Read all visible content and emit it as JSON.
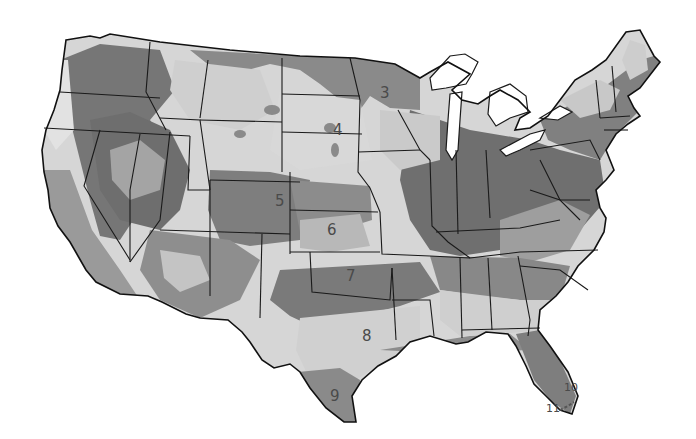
{
  "map": {
    "type": "zone-map",
    "region": "Contiguous United States",
    "style": "grayscale shaded zones with state boundaries",
    "colors": {
      "background": "#ffffff",
      "land_light": "#d9d9d9",
      "land_mid": "#a8a8a8",
      "land_dark": "#7d7d7d",
      "land_darkest": "#626262",
      "water": "#ffffff",
      "border": "#1a1a1a",
      "label": "#4a4a4a"
    },
    "zone_labels": [
      {
        "id": "3",
        "text": "3",
        "x": 380,
        "y": 98
      },
      {
        "id": "4",
        "text": "4",
        "x": 333,
        "y": 135
      },
      {
        "id": "5",
        "text": "5",
        "x": 275,
        "y": 206
      },
      {
        "id": "6",
        "text": "6",
        "x": 327,
        "y": 235
      },
      {
        "id": "7",
        "text": "7",
        "x": 346,
        "y": 281
      },
      {
        "id": "8",
        "text": "8",
        "x": 362,
        "y": 341
      },
      {
        "id": "9",
        "text": "9",
        "x": 330,
        "y": 401
      },
      {
        "id": "10",
        "text": "10",
        "x": 568,
        "y": 387
      },
      {
        "id": "11",
        "text": "11",
        "x": 552,
        "y": 409
      }
    ]
  }
}
